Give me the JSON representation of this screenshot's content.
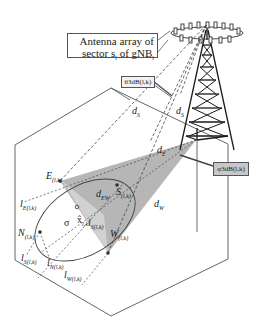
{
  "figure": {
    "callouts": {
      "antenna_array_line1": "Antenna array of",
      "antenna_array_line2_pre": "sector s",
      "antenna_array_line2_sub": "l",
      "antenna_array_line2_mid": " of gNB",
      "antenna_array_line2_sub2": "l",
      "theta_label": "θ3dB(l,k)",
      "phi_label": "φ3dB(l,k)"
    },
    "distances": {
      "dS_left": "d",
      "dS_left_sub": "S",
      "dS_right": "d",
      "dS_right_sub": "S",
      "dE": "d",
      "dE_sub": "E",
      "dW": "d",
      "dW_sub": "W",
      "dEW": "d",
      "dEW_sub": "EW"
    },
    "points": {
      "E": {
        "name": "E",
        "sub": "(l,k)"
      },
      "S": {
        "name": "S",
        "sub": "(l,k)"
      },
      "N": {
        "name": "N",
        "sub": "(l,k)"
      },
      "W": {
        "name": "W",
        "sub": "(l,k)"
      },
      "x_hat": {
        "name": "x̂",
        "sub": "l,k"
      },
      "sigma": {
        "name": "σ"
      }
    },
    "lines": {
      "lE": {
        "name": "l",
        "sub": "E(l,k)"
      },
      "lS_center": {
        "name": "l",
        "sub": "S(l,k)"
      },
      "lS": {
        "name": "l",
        "sub": "S(l,k)"
      },
      "lN": {
        "name": "l",
        "sub": "N(l,k)"
      },
      "lW": {
        "name": "l",
        "sub": "W(l,k)"
      }
    },
    "colors": {
      "beam_fill": "#a9a9a9",
      "beam_fill_light": "#c9c9c9",
      "line": "#333333",
      "tower": "#1a1a1a"
    }
  }
}
